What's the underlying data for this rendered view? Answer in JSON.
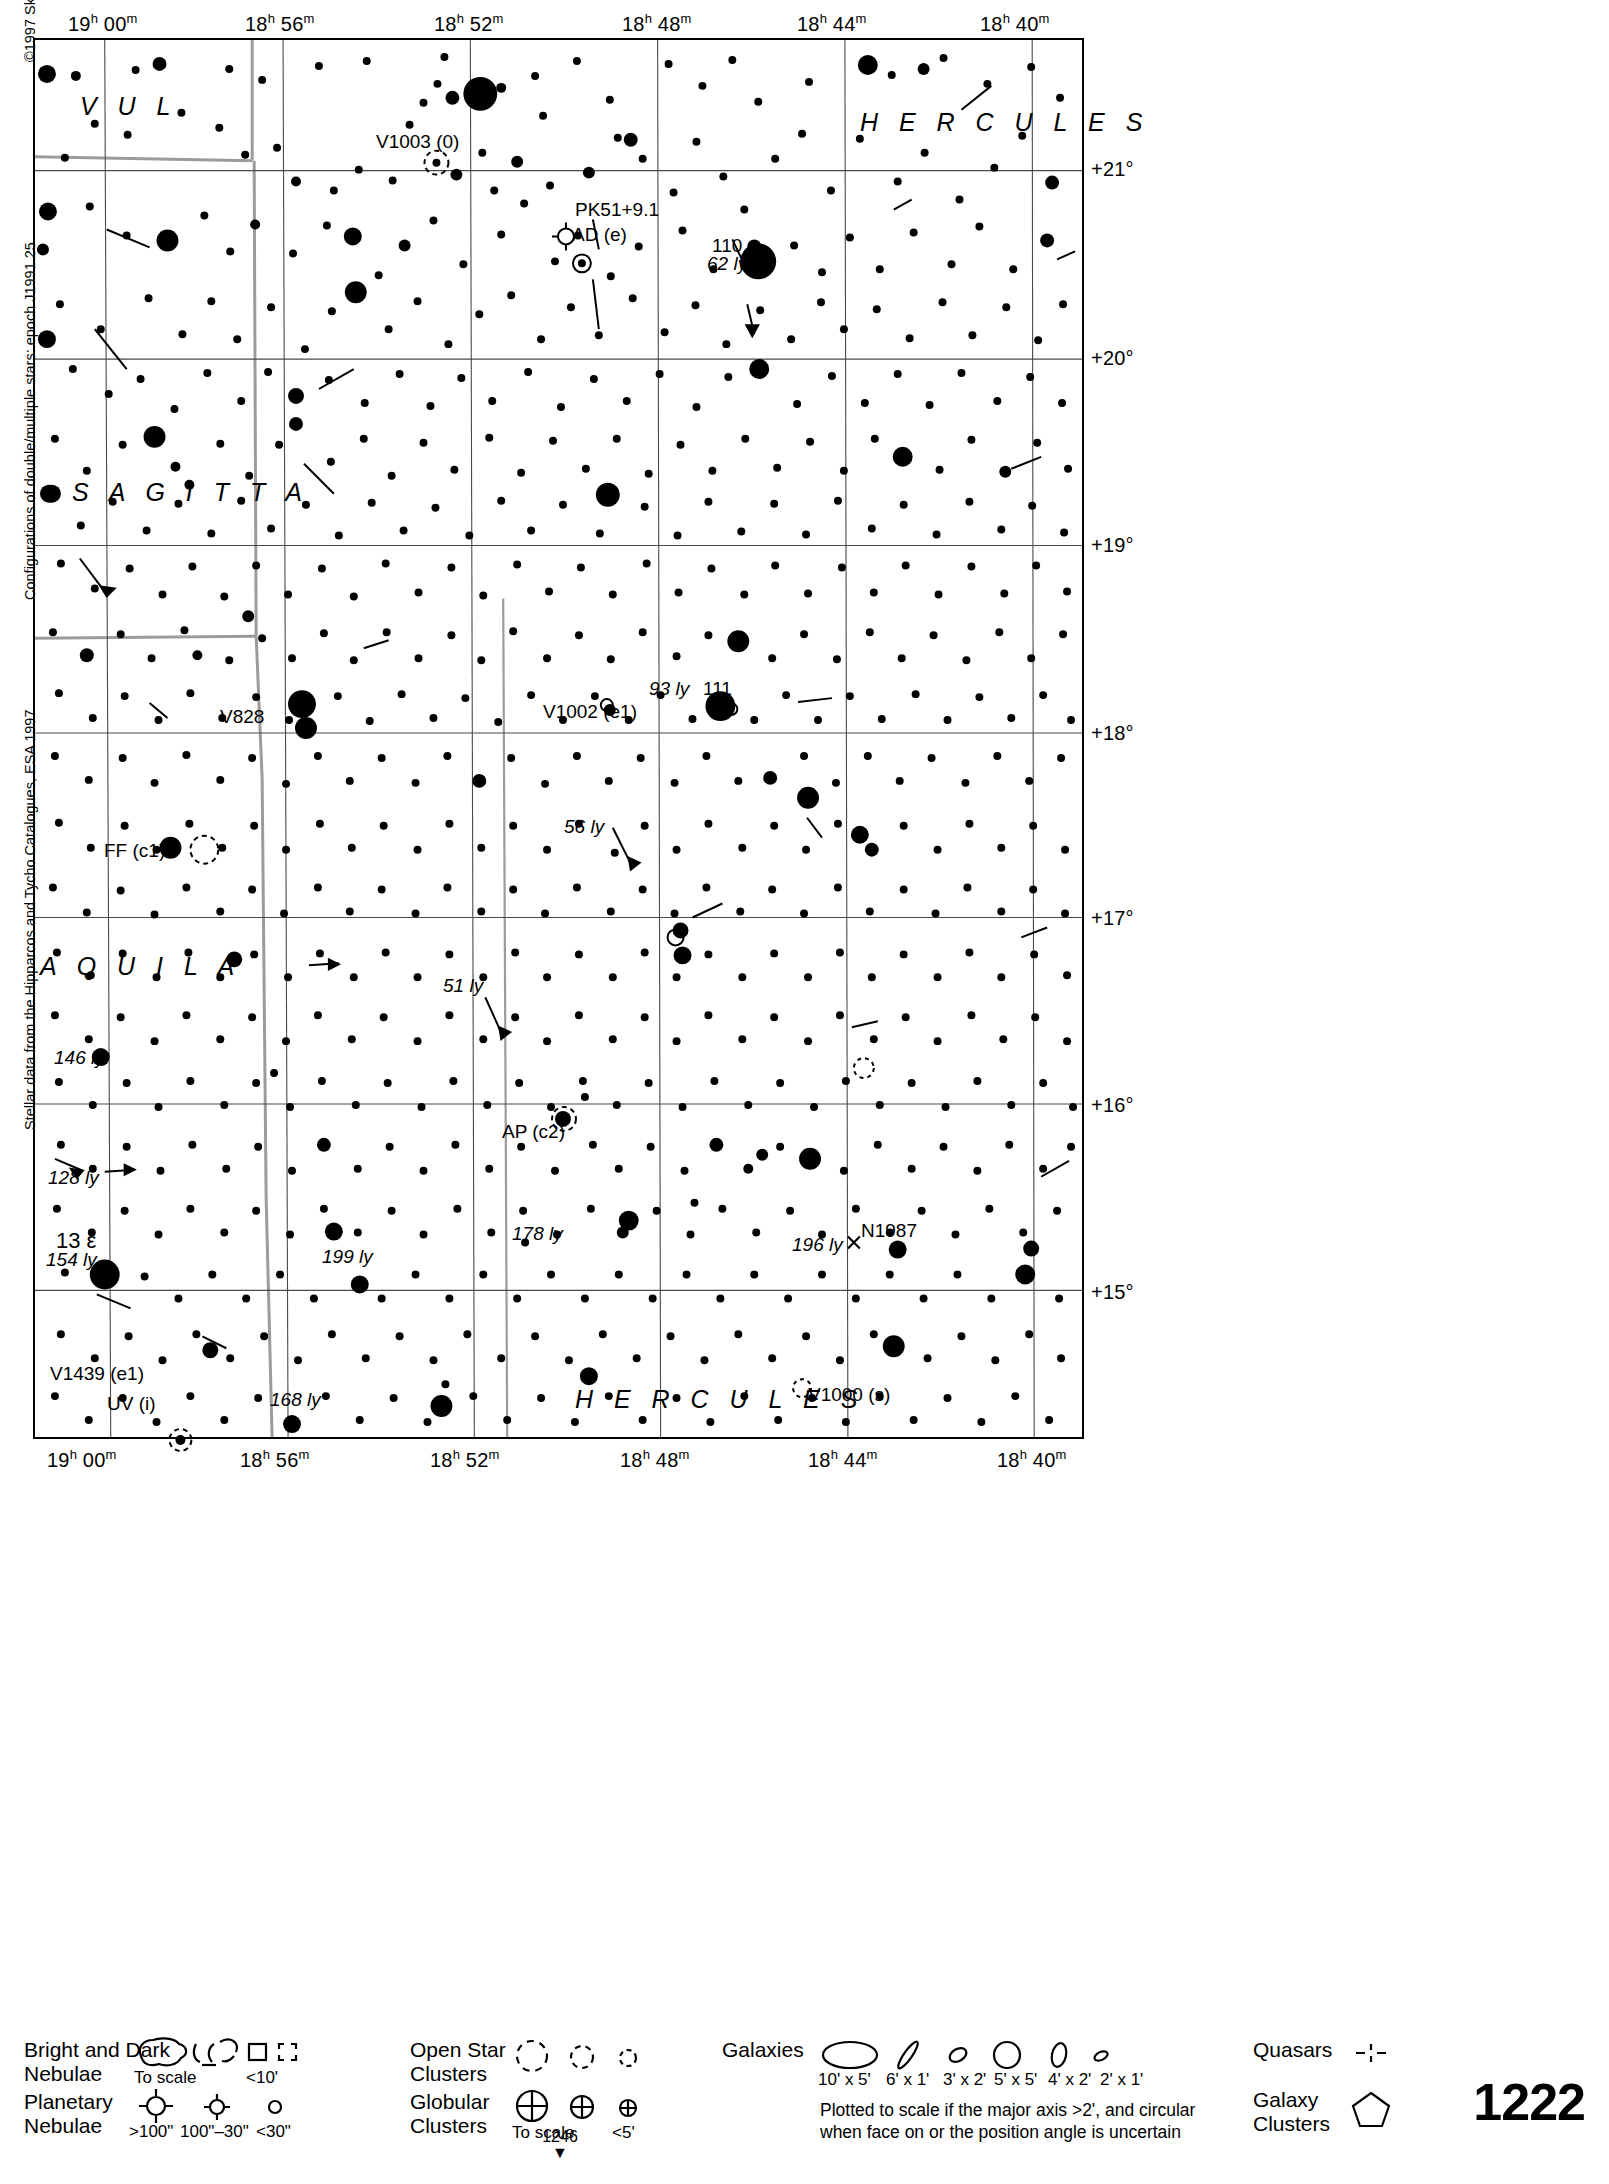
{
  "chart": {
    "number": "1222",
    "page_ref": "1246",
    "page_ref_arrow": "▼",
    "copyright": "©1997 Sky Publishing Corporation",
    "credit_epoch": "Configurations of double/multiple stars: epoch J1991.25",
    "credit_source": "Stellar data from the Hipparcos and Tycho Catalogues, ESA 1997"
  },
  "axes": {
    "ra_top": [
      {
        "h": "19",
        "m": "00",
        "x": 103
      },
      {
        "h": "18",
        "m": "56",
        "x": 281
      },
      {
        "h": "18",
        "m": "52",
        "x": 470
      },
      {
        "h": "18",
        "m": "48",
        "x": 658
      },
      {
        "h": "18",
        "m": "44",
        "x": 833
      },
      {
        "h": "18",
        "m": "40",
        "x": 1016
      }
    ],
    "ra_bottom": [
      {
        "h": "19",
        "m": "00",
        "x": 81
      },
      {
        "h": "18",
        "m": "56",
        "x": 278
      },
      {
        "h": "18",
        "m": "52",
        "x": 468
      },
      {
        "h": "18",
        "m": "48",
        "x": 657
      },
      {
        "h": "18",
        "m": "44",
        "x": 846
      },
      {
        "h": "18",
        "m": "40",
        "x": 1034
      }
    ],
    "dec_right": [
      {
        "label": "+21°",
        "y": 169
      },
      {
        "label": "+20°",
        "y": 358
      },
      {
        "label": "+19°",
        "y": 545
      },
      {
        "label": "+18°",
        "y": 733
      },
      {
        "label": "+17°",
        "y": 918
      },
      {
        "label": "+16°",
        "y": 1105
      },
      {
        "label": "+15°",
        "y": 1292
      }
    ]
  },
  "constellations": [
    {
      "name": "V U L",
      "x": 80,
      "y": 95
    },
    {
      "name": "H E R C U L E S",
      "x": 860,
      "y": 112
    },
    {
      "name": "S A G I T T A",
      "x": 72,
      "y": 482
    },
    {
      "name": "A Q U I L A",
      "x": 40,
      "y": 955
    },
    {
      "name": "H E R C U L E S",
      "x": 575,
      "y": 1391
    }
  ],
  "objects": [
    {
      "name": "112",
      "x": 466,
      "y": 86,
      "kind": "star-label"
    },
    {
      "name": "V1003 (0)",
      "x": 376,
      "y": 133,
      "kind": "variable-star-label"
    },
    {
      "name": "PK51+9.1",
      "x": 575,
      "y": 201,
      "kind": "planetary-nebula-label"
    },
    {
      "name": "AD (e)",
      "x": 572,
      "y": 226,
      "kind": "variable-star-label"
    },
    {
      "name": "110",
      "x": 714,
      "y": 236,
      "kind": "star-label"
    },
    {
      "name": "62 ly",
      "x": 710,
      "y": 252,
      "kind": "distance-label"
    },
    {
      "name": "111",
      "x": 703,
      "y": 680,
      "kind": "star-label"
    },
    {
      "name": "93 ly",
      "x": 651,
      "y": 679,
      "kind": "distance-label"
    },
    {
      "name": "V1002 (e1)",
      "x": 543,
      "y": 702,
      "kind": "variable-star-label"
    },
    {
      "name": "V828",
      "x": 220,
      "y": 708,
      "kind": "variable-star-label"
    },
    {
      "name": "56 ly",
      "x": 566,
      "y": 816,
      "kind": "distance-label"
    },
    {
      "name": "FF (c1)",
      "x": 104,
      "y": 841,
      "kind": "variable-star-label"
    },
    {
      "name": "51 ly",
      "x": 443,
      "y": 977,
      "kind": "distance-label"
    },
    {
      "name": "146 ly",
      "x": 54,
      "y": 1049,
      "kind": "distance-label"
    },
    {
      "name": "AP (c2)",
      "x": 502,
      "y": 1123,
      "kind": "variable-star-label"
    },
    {
      "name": "128 ly",
      "x": 48,
      "y": 1167,
      "kind": "distance-label"
    },
    {
      "name": "178 ly",
      "x": 512,
      "y": 1224,
      "kind": "distance-label"
    },
    {
      "name": "N1987",
      "x": 860,
      "y": 1222,
      "kind": "galaxy-label"
    },
    {
      "name": "13 ε",
      "x": 56,
      "y": 1232,
      "kind": "star-label"
    },
    {
      "name": "154 ly",
      "x": 48,
      "y": 1248,
      "kind": "distance-label"
    },
    {
      "name": "196 ly",
      "x": 792,
      "y": 1235,
      "kind": "distance-label"
    },
    {
      "name": "199 ly",
      "x": 322,
      "y": 1247,
      "kind": "distance-label"
    },
    {
      "name": "V1439 (e1)",
      "x": 50,
      "y": 1366,
      "kind": "variable-star-label"
    },
    {
      "name": "168 ly",
      "x": 271,
      "y": 1391,
      "kind": "distance-label"
    },
    {
      "name": "UV (i)",
      "x": 108,
      "y": 1396,
      "kind": "variable-star-label"
    },
    {
      "name": "V1000 (s)",
      "x": 808,
      "y": 1386,
      "kind": "variable-star-label"
    }
  ],
  "legend": {
    "nebulae": {
      "title": "Bright and Dark\nNebulae",
      "caption_to_scale": "To scale",
      "caption_small": "<10'"
    },
    "planetary": {
      "title": "Planetary\nNebulae",
      "caption_large": ">100\"",
      "caption_mid": "100\"–30\"",
      "caption_small": "<30\""
    },
    "open_clusters": {
      "title": "Open Star\nClusters"
    },
    "globular_clusters": {
      "title": "Globular\nClusters",
      "caption_to_scale": "To scale",
      "caption_small": "<5'"
    },
    "galaxies": {
      "title": "Galaxies",
      "sizes": [
        "10' x 5'",
        "6' x 1'",
        "3' x 2'",
        "5' x 5'",
        "4' x 2'",
        "2' x 1'"
      ],
      "note": "Plotted to scale if the major axis >2', and circular\nwhen face on or the position angle is uncertain"
    },
    "quasars": {
      "title": "Quasars"
    },
    "galaxy_clusters": {
      "title": "Galaxy\nClusters"
    }
  },
  "chart_data": {
    "type": "scatter",
    "xlabel": "Right Ascension",
    "ylabel": "Declination",
    "xlim": [
      "19h 00m",
      "18h 40m"
    ],
    "ylim": [
      "+14.6°",
      "+21.6°"
    ],
    "grid": true,
    "legend_position": "below-chart",
    "ra_gridlines": [
      "19h 00m",
      "18h 56m",
      "18h 52m",
      "18h 48m",
      "18h 44m",
      "18h 40m"
    ],
    "dec_gridlines": [
      "+21°",
      "+20°",
      "+19°",
      "+18°",
      "+17°",
      "+16°",
      "+15°"
    ],
    "named_stars": [
      {
        "label": "112",
        "mag": 4.6,
        "x": 445,
        "y": 92
      },
      {
        "label": "110",
        "mag": 4.2,
        "x": 755,
        "y": 256,
        "distance_ly": 62
      },
      {
        "label": "111",
        "mag": 4.4,
        "x": 688,
        "y": 703,
        "distance_ly": 93
      },
      {
        "label": "13 ε (Aql)",
        "mag": 4.0,
        "x": 101,
        "y": 1275,
        "distance_ly": 154
      }
    ],
    "variable_stars": [
      {
        "label": "V1003",
        "type": "0",
        "x": 404,
        "y": 125
      },
      {
        "label": "AD",
        "type": "e",
        "x": 557,
        "y": 228
      },
      {
        "label": "V1002",
        "type": "e1",
        "x": 575,
        "y": 694
      },
      {
        "label": "V828",
        "type": "",
        "x": 271,
        "y": 713
      },
      {
        "label": "FF",
        "type": "c1",
        "x": 170,
        "y": 849
      },
      {
        "label": "AP",
        "type": "c2",
        "x": 531,
        "y": 1112
      },
      {
        "label": "V1439",
        "type": "e1",
        "x": 44,
        "y": 1376
      },
      {
        "label": "UV",
        "type": "i",
        "x": 146,
        "y": 1404
      },
      {
        "label": "V1000",
        "type": "s",
        "x": 800,
        "y": 1395
      }
    ],
    "planetary_nebulae": [
      {
        "label": "PK51+9.1",
        "x": 566,
        "y": 199
      }
    ],
    "galaxies": [
      {
        "label": "N1987",
        "x": 851,
        "y": 1242
      }
    ],
    "distance_annotations": [
      {
        "value": 62,
        "unit": "ly"
      },
      {
        "value": 93,
        "unit": "ly"
      },
      {
        "value": 56,
        "unit": "ly"
      },
      {
        "value": 51,
        "unit": "ly"
      },
      {
        "value": 146,
        "unit": "ly"
      },
      {
        "value": 128,
        "unit": "ly"
      },
      {
        "value": 178,
        "unit": "ly"
      },
      {
        "value": 196,
        "unit": "ly"
      },
      {
        "value": 154,
        "unit": "ly"
      },
      {
        "value": 199,
        "unit": "ly"
      },
      {
        "value": 168,
        "unit": "ly"
      }
    ],
    "constellations_shown": [
      "VUL",
      "HERCULES",
      "SAGITTA",
      "AQUILA"
    ]
  }
}
